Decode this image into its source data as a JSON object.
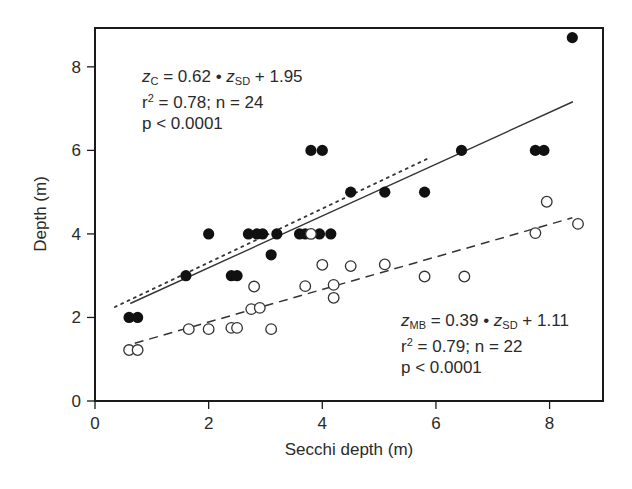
{
  "chart_data": {
    "type": "scatter",
    "title": "",
    "xlabel": "Secchi depth (m)",
    "ylabel": "Depth (m)",
    "xlim": [
      0,
      8.94
    ],
    "ylim": [
      0,
      8.93
    ],
    "xticks": [
      0,
      2,
      4,
      6,
      8
    ],
    "yticks": [
      0,
      2,
      4,
      6,
      8
    ],
    "grid": false,
    "legend": null,
    "series": [
      {
        "name": "z_C (filled circles)",
        "marker": "filled-circle",
        "color": "#111111",
        "points": [
          [
            0.6,
            2.0
          ],
          [
            0.75,
            2.0
          ],
          [
            1.6,
            3.0
          ],
          [
            2.0,
            4.0
          ],
          [
            2.4,
            3.0
          ],
          [
            2.5,
            3.0
          ],
          [
            2.7,
            4.0
          ],
          [
            2.85,
            4.0
          ],
          [
            2.95,
            4.0
          ],
          [
            3.1,
            3.5
          ],
          [
            3.2,
            4.0
          ],
          [
            3.6,
            4.0
          ],
          [
            3.7,
            4.0
          ],
          [
            3.8,
            6.0
          ],
          [
            3.95,
            4.0
          ],
          [
            4.0,
            6.0
          ],
          [
            4.15,
            4.0
          ],
          [
            4.5,
            5.0
          ],
          [
            5.1,
            5.0
          ],
          [
            5.8,
            5.0
          ],
          [
            6.45,
            6.0
          ],
          [
            7.75,
            6.0
          ],
          [
            7.9,
            6.0
          ],
          [
            8.4,
            8.7
          ]
        ]
      },
      {
        "name": "z_MB (open circles)",
        "marker": "open-circle",
        "color": "#333333",
        "points": [
          [
            0.6,
            1.22
          ],
          [
            0.75,
            1.22
          ],
          [
            1.65,
            1.72
          ],
          [
            2.0,
            1.72
          ],
          [
            2.4,
            1.75
          ],
          [
            2.5,
            1.75
          ],
          [
            2.75,
            2.2
          ],
          [
            2.9,
            2.23
          ],
          [
            2.8,
            2.74
          ],
          [
            3.1,
            1.72
          ],
          [
            3.7,
            2.75
          ],
          [
            3.8,
            4.0
          ],
          [
            4.0,
            3.26
          ],
          [
            4.2,
            2.78
          ],
          [
            4.2,
            2.47
          ],
          [
            4.5,
            3.23
          ],
          [
            5.1,
            3.27
          ],
          [
            5.8,
            2.98
          ],
          [
            6.5,
            2.98
          ],
          [
            7.75,
            4.02
          ],
          [
            7.95,
            4.77
          ],
          [
            8.5,
            4.24
          ]
        ]
      }
    ],
    "lines": [
      {
        "name": "z_C fit",
        "style": "solid",
        "slope": 0.62,
        "intercept": 1.95,
        "x_range": [
          0.62,
          8.41
        ]
      },
      {
        "name": "reference (dotted)",
        "style": "dotted",
        "from": [
          0.35,
          2.25
        ],
        "to": [
          5.85,
          5.8
        ]
      },
      {
        "name": "z_MB fit",
        "style": "dashed",
        "slope": 0.39,
        "intercept": 1.11,
        "x_range": [
          0.7,
          8.4
        ]
      }
    ],
    "annotations": [
      {
        "id": "zc",
        "lines": [
          "z_C = 0.62 • z_SD + 1.95",
          "r² = 0.78; n = 24",
          "p < 0.0001"
        ],
        "position": "upper-left"
      },
      {
        "id": "zmb",
        "lines": [
          "z_MB = 0.39 • z_SD + 1.11",
          "r² = 0.79; n = 22",
          "p < 0.0001"
        ],
        "position": "lower-right"
      }
    ]
  },
  "annotations": {
    "zc": {
      "var": "z",
      "sub": "C",
      "eq_mid": " = 0.62 • ",
      "var2": "z",
      "sub2": "SD",
      "eq_end": " + 1.95",
      "r_prefix": "r",
      "r_sup": "2",
      "r_rest": " = 0.78; n = 24",
      "p": "p < 0.0001"
    },
    "zmb": {
      "var": "z",
      "sub": "MB",
      "eq_mid": " = 0.39 • ",
      "var2": "z",
      "sub2": "SD",
      "eq_end": " + 1.11",
      "r_prefix": "r",
      "r_sup": "2",
      "r_rest": " = 0.79; n = 22",
      "p": "p < 0.0001"
    }
  },
  "axes": {
    "x_title": "Secchi depth (m)",
    "y_title": "Depth (m)"
  }
}
